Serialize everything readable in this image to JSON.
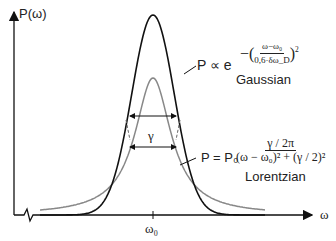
{
  "axes": {
    "y_label": "P(ω)",
    "x_label": "ω",
    "x_tick": "ω₀"
  },
  "gaussian": {
    "formula_lhs": "P ∝ e",
    "exponent_num": "ω−ω₀",
    "exponent_den": "0,6·δω_D",
    "exponent_power": "2",
    "name": "Gaussian",
    "color": "#111111"
  },
  "lorentzian": {
    "formula_lhs": "P = P₀",
    "num": "γ / 2π",
    "den": "(ω − ω₀)² + (γ / 2)²",
    "name": "Lorentzian",
    "color": "#888888"
  },
  "width_label": "γ",
  "chart_data": {
    "type": "line",
    "title": "",
    "xlabel": "ω",
    "ylabel": "P(ω)",
    "x_ticks": [
      "ω₀"
    ],
    "series": [
      {
        "name": "Gaussian",
        "peak_rel": 1.0,
        "shape": "exp(-((ω-ω0)/(0.6·δωD))^2)"
      },
      {
        "name": "Lorentzian",
        "peak_rel": 0.68,
        "shape": "(γ/2π)/((ω-ω0)^2+(γ/2)^2)"
      }
    ],
    "annotations": [
      "FWHM arrows marking width γ at half maximum"
    ],
    "grid": false
  }
}
